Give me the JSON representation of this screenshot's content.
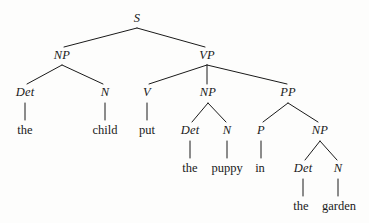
{
  "figure": {
    "type": "syntax-tree",
    "sentence": "the child put the puppy in the garden",
    "ink_color": "#1a1a1a",
    "background_color": "#fdfdfc"
  },
  "nodes": [
    {
      "id": "s",
      "label": "S",
      "kind": "category",
      "x": 137,
      "y": 18
    },
    {
      "id": "np1",
      "label": "NP",
      "kind": "category",
      "x": 62,
      "y": 55
    },
    {
      "id": "vp",
      "label": "VP",
      "kind": "category",
      "x": 207,
      "y": 55
    },
    {
      "id": "det1",
      "label": "Det",
      "kind": "category",
      "x": 25,
      "y": 92
    },
    {
      "id": "n1",
      "label": "N",
      "kind": "category",
      "x": 105,
      "y": 92
    },
    {
      "id": "v",
      "label": "V",
      "kind": "category",
      "x": 147,
      "y": 92
    },
    {
      "id": "np2",
      "label": "NP",
      "kind": "category",
      "x": 208,
      "y": 92
    },
    {
      "id": "pp",
      "label": "PP",
      "kind": "category",
      "x": 288,
      "y": 92
    },
    {
      "id": "the1",
      "label": "the",
      "kind": "leaf",
      "x": 25,
      "y": 130
    },
    {
      "id": "child",
      "label": "child",
      "kind": "leaf",
      "x": 105,
      "y": 130
    },
    {
      "id": "put",
      "label": "put",
      "kind": "leaf",
      "x": 147,
      "y": 130
    },
    {
      "id": "det2",
      "label": "Det",
      "kind": "category",
      "x": 190,
      "y": 130
    },
    {
      "id": "n2",
      "label": "N",
      "kind": "category",
      "x": 227,
      "y": 130
    },
    {
      "id": "p",
      "label": "P",
      "kind": "category",
      "x": 261,
      "y": 130
    },
    {
      "id": "np3",
      "label": "NP",
      "kind": "category",
      "x": 320,
      "y": 130
    },
    {
      "id": "the2",
      "label": "the",
      "kind": "leaf",
      "x": 190,
      "y": 168
    },
    {
      "id": "puppy",
      "label": "puppy",
      "kind": "leaf",
      "x": 227,
      "y": 168
    },
    {
      "id": "in",
      "label": "in",
      "kind": "leaf",
      "x": 260,
      "y": 168
    },
    {
      "id": "det3",
      "label": "Det",
      "kind": "category",
      "x": 303,
      "y": 168
    },
    {
      "id": "n3",
      "label": "N",
      "kind": "category",
      "x": 338,
      "y": 168
    },
    {
      "id": "the3",
      "label": "the",
      "kind": "leaf",
      "x": 301,
      "y": 206
    },
    {
      "id": "garden",
      "label": "garden",
      "kind": "leaf",
      "x": 339,
      "y": 206
    }
  ],
  "edges": [
    {
      "from": "s",
      "to": "np1",
      "x1": 137,
      "y1": 28,
      "x2": 64,
      "y2": 47
    },
    {
      "from": "s",
      "to": "vp",
      "x1": 137,
      "y1": 28,
      "x2": 205,
      "y2": 47
    },
    {
      "from": "np1",
      "to": "det1",
      "x1": 62,
      "y1": 65,
      "x2": 27,
      "y2": 84
    },
    {
      "from": "np1",
      "to": "n1",
      "x1": 62,
      "y1": 65,
      "x2": 103,
      "y2": 84
    },
    {
      "from": "vp",
      "to": "v",
      "x1": 207,
      "y1": 65,
      "x2": 149,
      "y2": 84
    },
    {
      "from": "vp",
      "to": "np2",
      "x1": 207,
      "y1": 65,
      "x2": 207,
      "y2": 84
    },
    {
      "from": "vp",
      "to": "pp",
      "x1": 207,
      "y1": 65,
      "x2": 287,
      "y2": 84
    },
    {
      "from": "det1",
      "to": "the1",
      "x1": 25,
      "y1": 103,
      "x2": 25,
      "y2": 120
    },
    {
      "from": "n1",
      "to": "child",
      "x1": 105,
      "y1": 103,
      "x2": 105,
      "y2": 120
    },
    {
      "from": "v",
      "to": "put",
      "x1": 147,
      "y1": 103,
      "x2": 147,
      "y2": 120
    },
    {
      "from": "np2",
      "to": "det2",
      "x1": 208,
      "y1": 103,
      "x2": 192,
      "y2": 122
    },
    {
      "from": "np2",
      "to": "n2",
      "x1": 208,
      "y1": 103,
      "x2": 226,
      "y2": 122
    },
    {
      "from": "pp",
      "to": "p",
      "x1": 288,
      "y1": 103,
      "x2": 263,
      "y2": 122
    },
    {
      "from": "pp",
      "to": "np3",
      "x1": 288,
      "y1": 103,
      "x2": 318,
      "y2": 122
    },
    {
      "from": "det2",
      "to": "the2",
      "x1": 190,
      "y1": 141,
      "x2": 190,
      "y2": 158
    },
    {
      "from": "n2",
      "to": "puppy",
      "x1": 227,
      "y1": 141,
      "x2": 227,
      "y2": 158
    },
    {
      "from": "p",
      "to": "in",
      "x1": 261,
      "y1": 141,
      "x2": 261,
      "y2": 158
    },
    {
      "from": "np3",
      "to": "det3",
      "x1": 320,
      "y1": 141,
      "x2": 305,
      "y2": 160
    },
    {
      "from": "np3",
      "to": "n3",
      "x1": 320,
      "y1": 141,
      "x2": 337,
      "y2": 160
    },
    {
      "from": "det3",
      "to": "the3",
      "x1": 303,
      "y1": 179,
      "x2": 303,
      "y2": 196
    },
    {
      "from": "n3",
      "to": "garden",
      "x1": 338,
      "y1": 179,
      "x2": 338,
      "y2": 196
    }
  ]
}
